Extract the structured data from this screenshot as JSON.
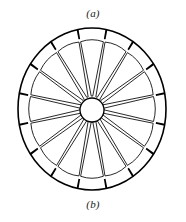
{
  "figure": {
    "caption_top": "(a)",
    "caption_bottom": "(b)",
    "background_color": "#ffffff",
    "ink_color": "#000000"
  },
  "emblem": {
    "name": "sixteen-petal-chrysanthemum",
    "petal_count": 16,
    "center_circle": {
      "cx": 92,
      "cy": 110,
      "r": 12,
      "fill": "#ffffff",
      "stroke": "#000000"
    },
    "outer_circle": {
      "cx": 92,
      "cy": 109,
      "rx": 74,
      "ry": 81,
      "fill": "none",
      "stroke": "#000000",
      "stroke_width": 1.6
    },
    "petal": {
      "fill": "#ffffff",
      "stroke": "#111111",
      "stroke_width": 0.9,
      "inner_radius_ratio": 0.16,
      "outer_radius_ratio": 0.88,
      "half_angle_deg": 10.5
    },
    "gap_wedge": {
      "fill": "#000000",
      "description": "dark triangular wedge between adjacent petal tips at the rim"
    },
    "rotation_deg": 0
  },
  "chart_data": {
    "type": "pie",
    "categories": [
      "petal"
    ],
    "values": [
      16
    ],
    "xlabel": "",
    "ylabel": "",
    "legend": []
  }
}
